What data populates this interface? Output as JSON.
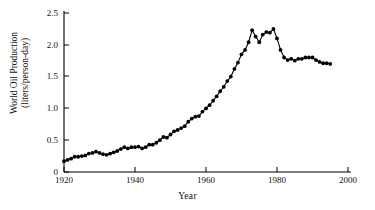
{
  "figure": {
    "background_color": "#ffffff",
    "ink_color": "#000000",
    "width": 375,
    "height": 210
  },
  "axes": {
    "y_title_line1": "World Oil Production",
    "y_title_line2": "(liters/person-day)",
    "x_title": "Year",
    "y_ticks": [
      "0",
      "0.5",
      "1.0",
      "1.5",
      "2.0",
      "2.5"
    ],
    "x_ticks": [
      "1920",
      "1940",
      "1960",
      "1980",
      "2000"
    ]
  },
  "chart_data": {
    "type": "line",
    "title": "",
    "subtitle": "",
    "xlabel": "Year",
    "ylabel": "World Oil Production (liters/person-day)",
    "xlim": [
      1920,
      2000
    ],
    "ylim": [
      0,
      2.5
    ],
    "xticks": [
      1920,
      1940,
      1960,
      1980,
      2000
    ],
    "yticks": [
      0,
      0.5,
      1.0,
      1.5,
      2.0,
      2.5
    ],
    "grid": false,
    "legend": "none",
    "marker": "filled-circle",
    "line_style": "solid-thin",
    "x": [
      1920,
      1921,
      1922,
      1923,
      1924,
      1925,
      1926,
      1927,
      1928,
      1929,
      1930,
      1931,
      1932,
      1933,
      1934,
      1935,
      1936,
      1937,
      1938,
      1939,
      1940,
      1941,
      1942,
      1943,
      1944,
      1945,
      1946,
      1947,
      1948,
      1949,
      1950,
      1951,
      1952,
      1953,
      1954,
      1955,
      1956,
      1957,
      1958,
      1959,
      1960,
      1961,
      1962,
      1963,
      1964,
      1965,
      1966,
      1967,
      1968,
      1969,
      1970,
      1971,
      1972,
      1973,
      1974,
      1975,
      1976,
      1977,
      1978,
      1979,
      1980,
      1981,
      1982,
      1983,
      1984,
      1985,
      1986,
      1987,
      1988,
      1989,
      1990,
      1991,
      1992,
      1993,
      1994,
      1995
    ],
    "y": [
      0.17,
      0.19,
      0.21,
      0.24,
      0.24,
      0.25,
      0.26,
      0.29,
      0.3,
      0.32,
      0.3,
      0.28,
      0.27,
      0.29,
      0.31,
      0.33,
      0.36,
      0.39,
      0.37,
      0.39,
      0.39,
      0.4,
      0.37,
      0.39,
      0.43,
      0.43,
      0.46,
      0.5,
      0.55,
      0.54,
      0.59,
      0.64,
      0.66,
      0.69,
      0.72,
      0.79,
      0.84,
      0.87,
      0.88,
      0.95,
      1.0,
      1.05,
      1.12,
      1.19,
      1.27,
      1.34,
      1.43,
      1.5,
      1.62,
      1.72,
      1.85,
      1.92,
      2.04,
      2.23,
      2.13,
      2.04,
      2.16,
      2.2,
      2.19,
      2.25,
      2.1,
      1.92,
      1.8,
      1.76,
      1.78,
      1.75,
      1.78,
      1.78,
      1.8,
      1.8,
      1.8,
      1.76,
      1.73,
      1.71,
      1.71,
      1.7
    ],
    "annotations": [
      {
        "label": "first peak",
        "x": 1973,
        "y": 2.23
      },
      {
        "label": "dip",
        "x": 1975,
        "y": 2.04
      },
      {
        "label": "second peak",
        "x": 1979,
        "y": 2.25
      },
      {
        "label": "depression dip",
        "x": 1932,
        "y": 0.27
      }
    ]
  }
}
